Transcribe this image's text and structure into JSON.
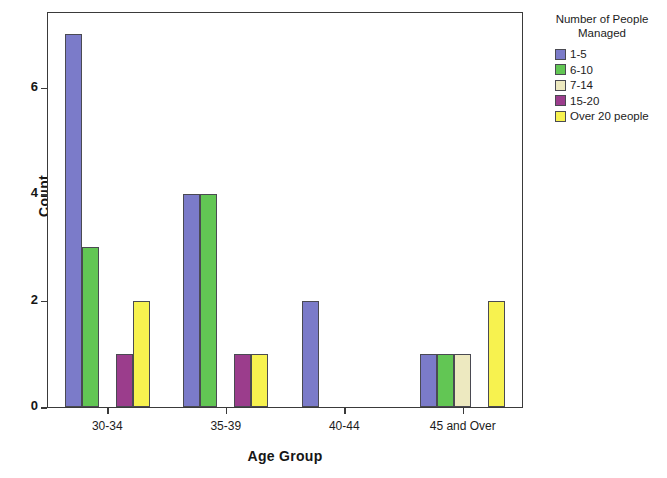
{
  "chart_data": {
    "type": "bar",
    "title": "",
    "xlabel": "Age Group",
    "ylabel": "Count",
    "categories": [
      "30-34",
      "35-39",
      "40-44",
      "45 and Over"
    ],
    "ylim": [
      0,
      7.4
    ],
    "yticks": [
      0,
      2,
      4,
      6
    ],
    "ytick_labels": [
      "0",
      "2",
      "4",
      "6"
    ],
    "grid": false,
    "legend_position": "right",
    "legend_title": "Number of People Managed",
    "legend_title_lines": [
      "Number of People",
      "Managed"
    ],
    "series": [
      {
        "name": "1-5",
        "color": "#7B7BC9",
        "values": [
          7,
          4,
          2,
          1
        ]
      },
      {
        "name": "6-10",
        "color": "#62C654",
        "values": [
          3,
          4,
          0,
          1
        ]
      },
      {
        "name": "7-14",
        "color": "#EDE9C0",
        "values": [
          0,
          0,
          0,
          1
        ]
      },
      {
        "name": "15-20",
        "color": "#9B3D8C",
        "values": [
          1,
          1,
          0,
          0
        ]
      },
      {
        "name": "Over 20 people",
        "color": "#F7F24F",
        "values": [
          2,
          1,
          0,
          2
        ]
      }
    ]
  }
}
